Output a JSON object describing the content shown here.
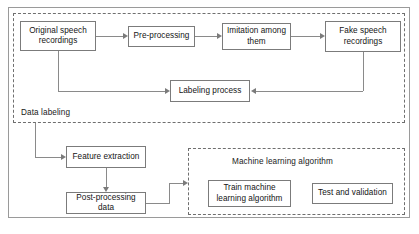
{
  "diagram": {
    "groups": [
      {
        "id": "data_labeling",
        "caption": "Data labeling",
        "style": "dashed"
      },
      {
        "id": "machine_learning",
        "caption": "Machine learning algorithm",
        "style": "dashed"
      }
    ],
    "nodes": [
      {
        "id": "original",
        "label": "Original speech recordings"
      },
      {
        "id": "preproc",
        "label": "Pre-processing"
      },
      {
        "id": "imitation",
        "label": "Imitation among them"
      },
      {
        "id": "fake",
        "label": "Fake speech recordings"
      },
      {
        "id": "labeling",
        "label": "Labeling process"
      },
      {
        "id": "feature",
        "label": "Feature extraction"
      },
      {
        "id": "postproc",
        "label": "Post-processing data"
      },
      {
        "id": "train",
        "label": "Train machine learning algorithm"
      },
      {
        "id": "test",
        "label": "Test and validation"
      }
    ],
    "edges": [
      {
        "from": "original",
        "to": "preproc",
        "direction": "right"
      },
      {
        "from": "preproc",
        "to": "imitation",
        "direction": "right"
      },
      {
        "from": "imitation",
        "to": "fake",
        "direction": "right"
      },
      {
        "from": "original",
        "to": "labeling",
        "direction": "right"
      },
      {
        "from": "fake",
        "to": "labeling",
        "direction": "left"
      },
      {
        "from": "original",
        "to": "feature",
        "direction": "right"
      },
      {
        "from": "feature",
        "to": "postproc",
        "direction": "down"
      },
      {
        "from": "postproc",
        "to": "train",
        "direction": "right"
      }
    ],
    "colors": {
      "box_border": "#7b7b7b",
      "group_border": "#6f6f6f",
      "frame_border": "#9a9a9a",
      "connector": "#8a8a8a",
      "text": "#141414",
      "background": "#ffffff"
    }
  }
}
